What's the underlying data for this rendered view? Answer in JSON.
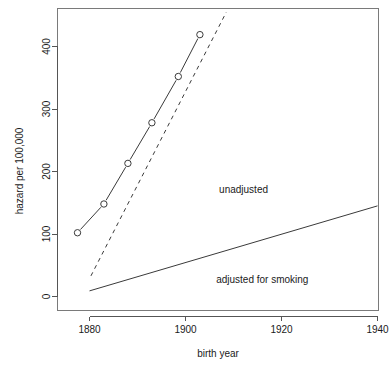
{
  "chart_data": {
    "type": "line",
    "title": "",
    "xlabel": "birth year",
    "ylabel": "hazard per 100,000",
    "xlim": [
      1872,
      1944
    ],
    "ylim": [
      -18,
      455
    ],
    "xticks": [
      1880,
      1900,
      1920,
      1940
    ],
    "yticks": [
      0,
      100,
      200,
      300,
      400
    ],
    "xtick_labels": [
      "1880",
      "1900",
      "1920",
      "1940"
    ],
    "ytick_labels": [
      "0",
      "100",
      "200",
      "300",
      "400"
    ],
    "grid": false,
    "legend": "none",
    "series": [
      {
        "name": "unadjusted",
        "style": "solid-with-open-circle-markers",
        "x": [
          1877.5,
          1883,
          1888,
          1893,
          1898.5,
          1903
        ],
        "values": [
          102,
          148,
          213,
          278,
          352,
          419
        ]
      },
      {
        "name": "unadjusted-trend",
        "style": "dashed",
        "x": [
          1880.3,
          1908.5
        ],
        "values": [
          33,
          455
        ]
      },
      {
        "name": "adjusted for smoking",
        "style": "solid",
        "x": [
          1880,
          1940
        ],
        "values": [
          9,
          145
        ]
      }
    ],
    "annotations": [
      {
        "text": "unadjusted",
        "x": 1907,
        "y": 165
      },
      {
        "text": "adjusted for smoking",
        "x": 1916,
        "y": 22
      }
    ]
  }
}
